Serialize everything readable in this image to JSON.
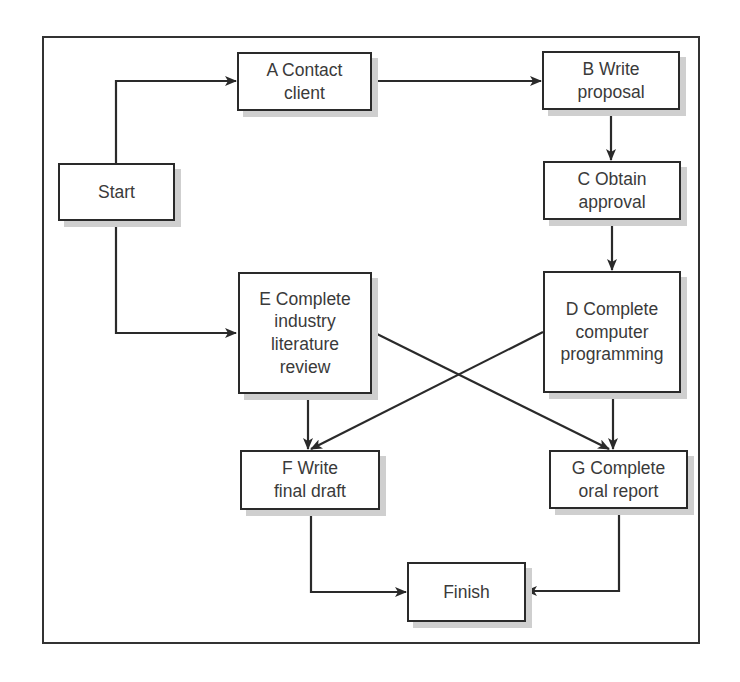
{
  "diagram": {
    "type": "flowchart",
    "colors": {
      "line": "#2a2a2a",
      "shadow": "#cfcfcf",
      "text": "#3a3a3a"
    },
    "nodes": {
      "start": {
        "label": "Start"
      },
      "a": {
        "label": "A Contact\nclient"
      },
      "b": {
        "label": "B Write\nproposal"
      },
      "c": {
        "label": "C Obtain\napproval"
      },
      "d": {
        "label": "D Complete\ncomputer\nprogramming"
      },
      "e": {
        "label": "E Complete\nindustry\nliterature\nreview"
      },
      "f": {
        "label": "F Write\nfinal draft"
      },
      "g": {
        "label": "G Complete\noral report"
      },
      "finish": {
        "label": "Finish"
      }
    },
    "edges": [
      {
        "from": "Start",
        "to": "A"
      },
      {
        "from": "Start",
        "to": "E"
      },
      {
        "from": "A",
        "to": "B"
      },
      {
        "from": "B",
        "to": "C"
      },
      {
        "from": "C",
        "to": "D"
      },
      {
        "from": "D",
        "to": "F"
      },
      {
        "from": "D",
        "to": "G"
      },
      {
        "from": "E",
        "to": "F"
      },
      {
        "from": "E",
        "to": "G"
      },
      {
        "from": "F",
        "to": "Finish"
      },
      {
        "from": "G",
        "to": "Finish"
      }
    ]
  }
}
